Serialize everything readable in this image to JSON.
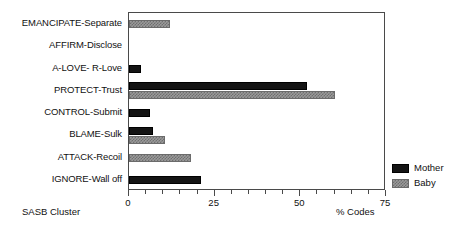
{
  "chart_data": {
    "type": "bar",
    "orientation": "horizontal",
    "title": "",
    "xlabel": "% Codes",
    "ylabel": "SASB Cluster",
    "xlim": [
      0,
      75
    ],
    "xticks": [
      0,
      25,
      50,
      75
    ],
    "xtick_labels": [
      "0",
      "25",
      "50",
      "75"
    ],
    "minor_ticks_per_interval": 5,
    "grid": false,
    "legend_position": "bottom-right",
    "categories": [
      "EMANCIPATE-Separate",
      "AFFIRM-Disclose",
      "A-LOVE- R-Love",
      "PROTECT-Trust",
      "CONTROL-Submit",
      "BLAME-Sulk",
      "ATTACK-Recoil",
      "IGNORE-Wall off"
    ],
    "series": [
      {
        "name": "Mother",
        "color": "#141414",
        "values": [
          0,
          0,
          3.5,
          52,
          6,
          7,
          0,
          21
        ]
      },
      {
        "name": "Baby",
        "color": "#9a9a9a",
        "values": [
          12,
          0,
          0,
          60,
          0,
          10.5,
          18,
          0
        ]
      }
    ]
  },
  "axes": {
    "x_title": "% Codes",
    "y_title": "SASB Cluster"
  },
  "legend": {
    "entries": [
      {
        "label": "Mother",
        "swatch": "solid-black-swatch"
      },
      {
        "label": "Baby",
        "swatch": "grey-hatched-swatch"
      }
    ]
  },
  "caption": {
    "clipped_text": ""
  }
}
